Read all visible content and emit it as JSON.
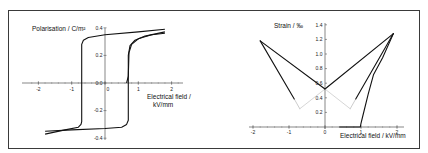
{
  "chart_data": [
    {
      "type": "line",
      "title": "",
      "ylabel": "Polarisation / C/m²",
      "xlabel": "Electrical field / kV/mm",
      "xlabel_lines": [
        "Electrical field /",
        "kV/mm"
      ],
      "xlim": [
        -2.3,
        2.3
      ],
      "ylim": [
        -0.4,
        0.4
      ],
      "x_ticks": [
        "-2",
        "-1",
        "0",
        "1",
        "2"
      ],
      "y_ticks": [
        "0.4",
        "0.2",
        "0.0",
        "-0.2",
        "-0.4"
      ],
      "grid": false,
      "legend": null,
      "series": [
        {
          "name": "hysteresis loop (upper/descending branch)",
          "x": [
            1.8,
            1.0,
            0.0,
            -0.5,
            -0.65,
            -0.7,
            -0.7,
            -0.72,
            -0.8,
            -1.2,
            -1.8
          ],
          "y": [
            0.39,
            0.37,
            0.35,
            0.33,
            0.31,
            0.28,
            -0.28,
            -0.3,
            -0.32,
            -0.34,
            -0.37
          ]
        },
        {
          "name": "hysteresis loop (lower/ascending branch)",
          "x": [
            -1.8,
            -1.0,
            0.0,
            0.5,
            0.65,
            0.7,
            0.7,
            0.75,
            0.9,
            1.2,
            1.8
          ],
          "y": [
            -0.35,
            -0.34,
            -0.33,
            -0.32,
            -0.3,
            -0.27,
            0.2,
            0.27,
            0.31,
            0.34,
            0.37
          ]
        },
        {
          "name": "initial curve",
          "x": [
            0.65,
            0.7,
            0.72,
            0.8,
            1.0,
            1.4,
            1.8
          ],
          "y": [
            0.0,
            0.05,
            0.22,
            0.28,
            0.32,
            0.35,
            0.36
          ]
        }
      ]
    },
    {
      "type": "line",
      "title": "",
      "ylabel": "Strain / ‰",
      "xlabel": "Electrical field / kV/mm",
      "xlim": [
        -2.1,
        2.1
      ],
      "ylim": [
        0,
        1.4
      ],
      "x_ticks": [
        "-2",
        "-1",
        "0",
        "1",
        "2"
      ],
      "y_ticks": [
        "1.4",
        "1.2",
        "1.0",
        "0.8",
        "0.6",
        "0.4",
        "0.2"
      ],
      "grid": false,
      "legend": null,
      "series": [
        {
          "name": "butterfly loop (negative field branch)",
          "x": [
            -1.8,
            -0.85,
            -0.7,
            0.0,
            1.9
          ],
          "y": [
            1.18,
            0.38,
            0.25,
            0.52,
            1.28
          ]
        },
        {
          "name": "butterfly loop (positive field branch)",
          "x": [
            1.9,
            0.85,
            0.7,
            0.0,
            -1.8
          ],
          "y": [
            1.28,
            0.38,
            0.25,
            0.52,
            1.18
          ]
        },
        {
          "name": "initial curve",
          "x": [
            0.4,
            0.98,
            1.0,
            1.05,
            1.2,
            1.35,
            1.6,
            1.9
          ],
          "y": [
            0.0,
            0.0,
            0.05,
            0.15,
            0.45,
            0.72,
            0.95,
            1.28
          ]
        }
      ]
    }
  ]
}
